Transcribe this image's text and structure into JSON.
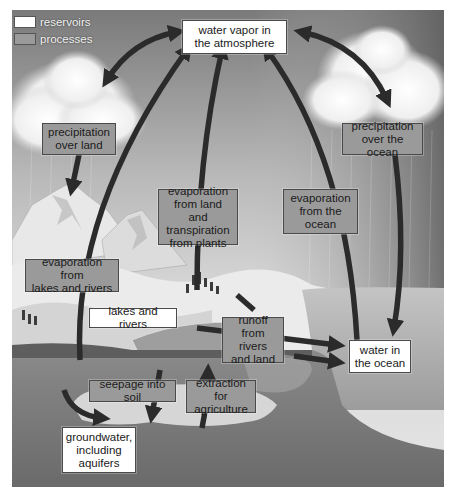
{
  "diagram": {
    "type": "water cycle",
    "colors": {
      "reservoir_fill": "#ffffff",
      "process_fill": "#9a9a9a",
      "arrow": "#2b2b2b",
      "sky_dark": "#6e6e6e",
      "sky_light": "#cfcfcf",
      "ocean": "#a8a8a8",
      "ground": "#7d7d7d"
    },
    "legend": [
      {
        "label": "reservoirs",
        "kind": "reservoir"
      },
      {
        "label": "processes",
        "kind": "process"
      }
    ],
    "reservoirs": {
      "atmosphere": "water vapor in the atmosphere",
      "lakes": "lakes and rivers",
      "ocean": "water in the ocean",
      "groundwater": "groundwater, including aquifers"
    },
    "reservoir_lines": {
      "atmosphere": [
        "water vapor in",
        "the atmosphere"
      ],
      "ocean": [
        "water in",
        "the ocean"
      ],
      "groundwater": [
        "groundwater,",
        "including",
        "aquifers"
      ]
    },
    "processes": {
      "precip_land": [
        "precipitation",
        "over land"
      ],
      "precip_ocean": [
        "precipitation",
        "over the ocean"
      ],
      "evap_land": [
        "evaporation",
        "from land and",
        "transpiration",
        "from plants"
      ],
      "evap_ocean": [
        "evaporation",
        "from the",
        "ocean"
      ],
      "evap_lakes": [
        "evaporation from",
        "lakes and rivers"
      ],
      "runoff": [
        "runoff",
        "from rivers",
        "and land"
      ],
      "seepage": "seepage into soil",
      "extraction": [
        "extraction for",
        "agriculture"
      ]
    },
    "flows": [
      {
        "from": "water vapor in the atmosphere",
        "to": "land",
        "via": "precipitation over land"
      },
      {
        "from": "water vapor in the atmosphere",
        "to": "water in the ocean",
        "via": "precipitation over the ocean"
      },
      {
        "from": "land and plants",
        "to": "water vapor in the atmosphere",
        "via": "evaporation from land and transpiration from plants"
      },
      {
        "from": "water in the ocean",
        "to": "water vapor in the atmosphere",
        "via": "evaporation from the ocean"
      },
      {
        "from": "lakes and rivers",
        "to": "water vapor in the atmosphere",
        "via": "evaporation from lakes and rivers"
      },
      {
        "from": "lakes and rivers / land",
        "to": "water in the ocean",
        "via": "runoff from rivers and land"
      },
      {
        "from": "land",
        "to": "groundwater, including aquifers",
        "via": "seepage into soil"
      },
      {
        "from": "groundwater, including aquifers",
        "to": "land",
        "via": "extraction for agriculture"
      }
    ]
  }
}
